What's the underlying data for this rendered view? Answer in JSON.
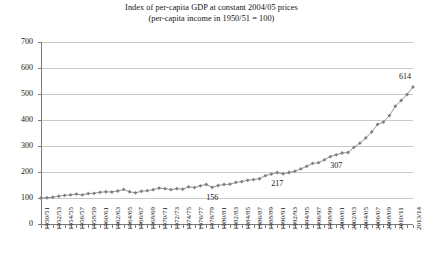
{
  "chart_data": {
    "type": "line",
    "title": "Index of per-capita GDP at constant 2004/05 prices",
    "subtitle": "(per-capita income in 1950/51 = 100)",
    "xlabel": "",
    "ylabel": "",
    "ylim": [
      0,
      700
    ],
    "ytick_step": 100,
    "yticks": [
      "0",
      "100",
      "200",
      "300",
      "400",
      "500",
      "600",
      "700"
    ],
    "grid": true,
    "legend": "none",
    "marker": "diamond",
    "series_color": "#808080",
    "line_color": "#8a8a8a",
    "x": [
      "1950/51",
      "1951/52",
      "1952/53",
      "1953/54",
      "1954/55",
      "1955/56",
      "1956/57",
      "1957/58",
      "1958/59",
      "1959/60",
      "1960/61",
      "1961/62",
      "1962/63",
      "1963/64",
      "1964/65",
      "1965/66",
      "1966/67",
      "1967/68",
      "1968/69",
      "1969/70",
      "1970/71",
      "1971/72",
      "1972/73",
      "1973/74",
      "1974/75",
      "1975/76",
      "1976/77",
      "1977/78",
      "1978/79",
      "1979/80",
      "1980/81",
      "1981/82",
      "1982/83",
      "1983/84",
      "1984/85",
      "1985/86",
      "1986/87",
      "1987/88",
      "1988/89",
      "1989/90",
      "1990/91",
      "1991/92",
      "1992/93",
      "1993/94",
      "1994/95",
      "1995/96",
      "1996/97",
      "1997/98",
      "1998/99",
      "1999/00",
      "2000/01",
      "2001/02",
      "2002/03",
      "2003/04",
      "2004/05",
      "2005/06",
      "2006/07",
      "2007/08",
      "2008/09",
      "2009/10",
      "2010/11",
      "2011/12",
      "2012/13",
      "2013/14"
    ],
    "xtick_labels": [
      "1950/51",
      "1952/53",
      "1954/55",
      "1956/57",
      "1958/59",
      "1960/61",
      "1962/63",
      "1964/65",
      "1966/67",
      "1968/69",
      "1970/71",
      "1972/73",
      "1974/75",
      "1976/77",
      "1978/79",
      "1980/81",
      "1982/83",
      "1984/85",
      "1986/87",
      "1988/89",
      "1990/91",
      "1992/93",
      "1994/95",
      "1996/97",
      "1998/99",
      "2000/01",
      "2002/03",
      "2004/05",
      "2006/07",
      "2008/09",
      "2010/11",
      "2013/14"
    ],
    "values": [
      100,
      101,
      103,
      107,
      110,
      112,
      115,
      112,
      117,
      118,
      122,
      124,
      123,
      127,
      133,
      124,
      120,
      126,
      128,
      132,
      138,
      136,
      132,
      136,
      134,
      143,
      140,
      147,
      152,
      141,
      148,
      152,
      153,
      160,
      163,
      168,
      171,
      174,
      186,
      192,
      198,
      193,
      198,
      203,
      212,
      222,
      233,
      236,
      247,
      259,
      266,
      273,
      275,
      295,
      311,
      331,
      354,
      383,
      392,
      417,
      453,
      475,
      498,
      527
    ],
    "annotations": [
      {
        "label": "156",
        "at_x": "1979/80",
        "value": 156
      },
      {
        "label": "217",
        "at_x": "1990/91",
        "value": 217
      },
      {
        "label": "307",
        "at_x": "2000/01",
        "value": 307
      },
      {
        "label": "614",
        "at_x": "2013/14",
        "value": 614
      }
    ]
  }
}
